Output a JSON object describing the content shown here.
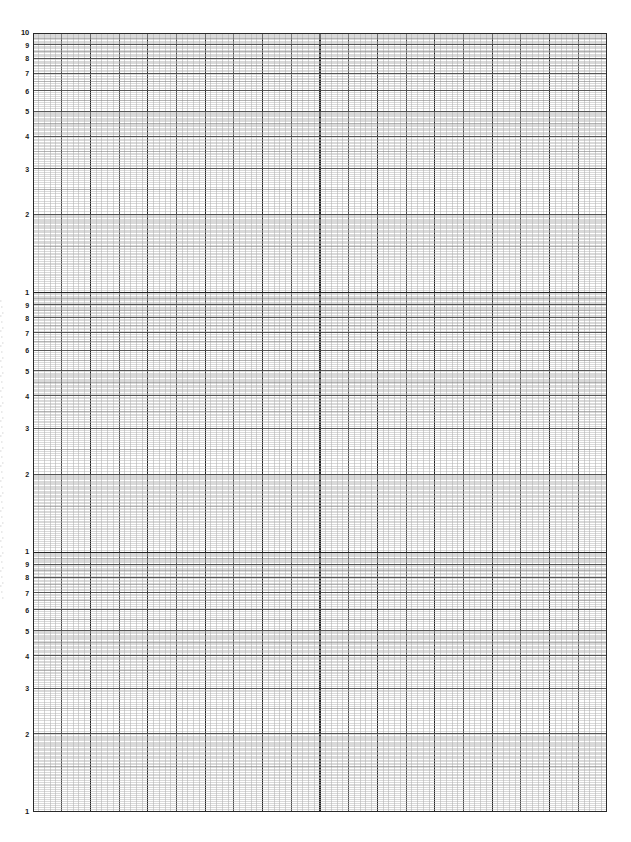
{
  "document": {
    "title": "Logarithmic Graph Paper",
    "sheet_type": "3-cycle semi-log graph paper",
    "width_px": 631,
    "height_px": 842,
    "background_color": "#ffffff"
  },
  "plot": {
    "left_px": 33,
    "top_px": 33,
    "width_px": 574,
    "height_px": 779,
    "border_color": "#2a2a2a"
  },
  "colors": {
    "minor_line": "#b4b4b4",
    "mid_line": "#8a8a8a",
    "major_line": "#4d4d4d",
    "decade_line": "#242424",
    "border": "#2a2a2a",
    "label_text": "#1a1a1a"
  },
  "x_axis": {
    "scale": "linear",
    "minor_divisions": 100,
    "minor_spacing_px": 5.74,
    "major_every_n_minor": 5,
    "tick_labels": []
  },
  "y_axis": {
    "scale": "logarithmic",
    "cycles": 3,
    "cycle_height_px": 259.67,
    "decade_labels_per_cycle": [
      "10",
      "9",
      "8",
      "7",
      "6",
      "5",
      "4",
      "3",
      "2",
      "1"
    ],
    "subdivisions_per_decade": 10
  },
  "chart_data": {
    "type": "line",
    "title": "",
    "subtitle": "",
    "xlabel": "",
    "ylabel": "",
    "grid": true,
    "legend": null,
    "series": [],
    "x": [],
    "values": [],
    "xscale": "linear",
    "yscale": "log",
    "xlim": [
      0,
      100
    ],
    "ylim": [
      1,
      1000
    ],
    "y_tick_labels": [
      {
        "value": 1000,
        "label": "10",
        "decade": 0,
        "major": true
      },
      {
        "value": 900,
        "label": "9",
        "decade": 0,
        "major": false
      },
      {
        "value": 800,
        "label": "8",
        "decade": 0,
        "major": false
      },
      {
        "value": 700,
        "label": "7",
        "decade": 0,
        "major": false
      },
      {
        "value": 600,
        "label": "6",
        "decade": 0,
        "major": false
      },
      {
        "value": 500,
        "label": "5",
        "decade": 0,
        "major": false
      },
      {
        "value": 400,
        "label": "4",
        "decade": 0,
        "major": false
      },
      {
        "value": 300,
        "label": "3",
        "decade": 0,
        "major": false
      },
      {
        "value": 200,
        "label": "2",
        "decade": 0,
        "major": false
      },
      {
        "value": 100,
        "label": "1",
        "decade": 1,
        "major": true
      },
      {
        "value": 90,
        "label": "9",
        "decade": 1,
        "major": false
      },
      {
        "value": 80,
        "label": "8",
        "decade": 1,
        "major": false
      },
      {
        "value": 70,
        "label": "7",
        "decade": 1,
        "major": false
      },
      {
        "value": 60,
        "label": "6",
        "decade": 1,
        "major": false
      },
      {
        "value": 50,
        "label": "5",
        "decade": 1,
        "major": false
      },
      {
        "value": 40,
        "label": "4",
        "decade": 1,
        "major": false
      },
      {
        "value": 30,
        "label": "3",
        "decade": 1,
        "major": false
      },
      {
        "value": 20,
        "label": "2",
        "decade": 1,
        "major": false
      },
      {
        "value": 10,
        "label": "1",
        "decade": 2,
        "major": true
      },
      {
        "value": 9,
        "label": "9",
        "decade": 2,
        "major": false
      },
      {
        "value": 8,
        "label": "8",
        "decade": 2,
        "major": false
      },
      {
        "value": 7,
        "label": "7",
        "decade": 2,
        "major": false
      },
      {
        "value": 6,
        "label": "6",
        "decade": 2,
        "major": false
      },
      {
        "value": 5,
        "label": "5",
        "decade": 2,
        "major": false
      },
      {
        "value": 4,
        "label": "4",
        "decade": 2,
        "major": false
      },
      {
        "value": 3,
        "label": "3",
        "decade": 2,
        "major": false
      },
      {
        "value": 2,
        "label": "2",
        "decade": 2,
        "major": false
      },
      {
        "value": 1,
        "label": "1",
        "decade": 3,
        "major": true
      }
    ]
  }
}
